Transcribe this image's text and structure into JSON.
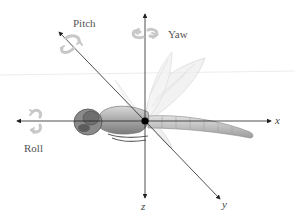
{
  "diagram": {
    "rotation_labels": {
      "pitch": "Pitch",
      "yaw": "Yaw",
      "roll": "Roll"
    },
    "axis_labels": {
      "x": "x",
      "y": "y",
      "z": "z"
    },
    "icons": {
      "pitch": "rotation-arrow-icon",
      "yaw": "rotation-arrow-icon",
      "roll": "rotation-arrow-icon",
      "center": "center-of-mass-dot"
    },
    "colors": {
      "axis": "#222222",
      "rotation_arrow": "#c8c8c8",
      "label": "#555555",
      "center_dot": "#000000",
      "dragonfly_body": "#9a9a9a",
      "wing": "#d4d4d4"
    }
  }
}
